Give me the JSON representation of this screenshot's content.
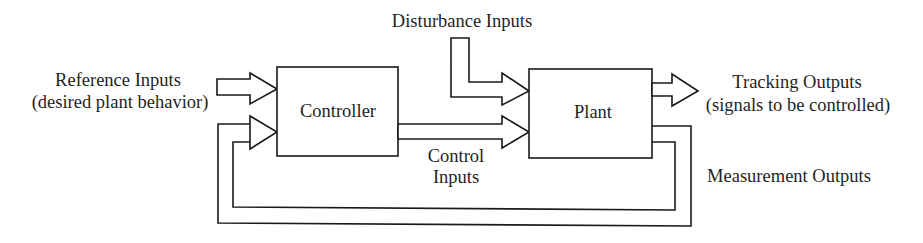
{
  "diagram": {
    "type": "control-system-block-diagram",
    "blocks": {
      "controller": {
        "label": "Controller"
      },
      "plant": {
        "label": "Plant"
      }
    },
    "signals": {
      "reference": {
        "line1": "Reference Inputs",
        "line2": "(desired plant behavior)"
      },
      "disturbance": {
        "label": "Disturbance Inputs"
      },
      "control": {
        "line1": "Control",
        "line2": "Inputs"
      },
      "tracking": {
        "line1": "Tracking Outputs",
        "line2": "(signals to be controlled)"
      },
      "measurement": {
        "label": "Measurement Outputs"
      }
    },
    "connections": [
      {
        "from": "Reference Inputs",
        "to": "Controller"
      },
      {
        "from": "Disturbance Inputs",
        "to": "Plant"
      },
      {
        "from": "Controller",
        "to": "Plant",
        "via": "Control Inputs"
      },
      {
        "from": "Plant",
        "to": "Tracking Outputs"
      },
      {
        "from": "Plant",
        "to": "Controller",
        "via": "Measurement Outputs"
      }
    ],
    "colors": {
      "line": "#1a1a1a",
      "background": "#ffffff"
    }
  }
}
